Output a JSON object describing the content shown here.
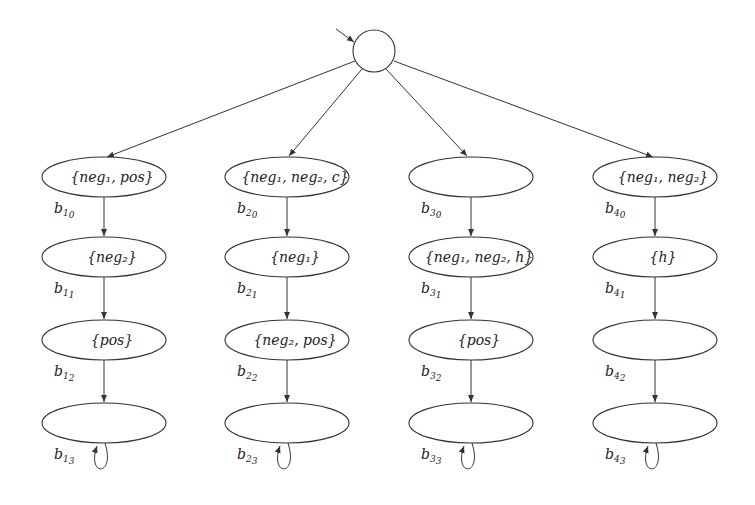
{
  "diagram": {
    "type": "automaton",
    "initial_state": {
      "label": ""
    },
    "branches": [
      {
        "id": "b1",
        "states": [
          {
            "label": "{neg₁, pos}",
            "name": "b",
            "sub1": "1",
            "sub2": "0"
          },
          {
            "label": "{neg₂}",
            "name": "b",
            "sub1": "1",
            "sub2": "1"
          },
          {
            "label": "{pos}",
            "name": "b",
            "sub1": "1",
            "sub2": "2"
          },
          {
            "label": "",
            "name": "b",
            "sub1": "1",
            "sub2": "3"
          }
        ]
      },
      {
        "id": "b2",
        "states": [
          {
            "label": "{neg₁, neg₂, c}",
            "name": "b",
            "sub1": "2",
            "sub2": "0"
          },
          {
            "label": "{neg₁}",
            "name": "b",
            "sub1": "2",
            "sub2": "1"
          },
          {
            "label": "{neg₂, pos}",
            "name": "b",
            "sub1": "2",
            "sub2": "2"
          },
          {
            "label": "",
            "name": "b",
            "sub1": "2",
            "sub2": "3"
          }
        ]
      },
      {
        "id": "b3",
        "states": [
          {
            "label": "",
            "name": "b",
            "sub1": "3",
            "sub2": "0"
          },
          {
            "label": "{neg₁, neg₂, h}",
            "name": "b",
            "sub1": "3",
            "sub2": "1"
          },
          {
            "label": "{pos}",
            "name": "b",
            "sub1": "3",
            "sub2": "2"
          },
          {
            "label": "",
            "name": "b",
            "sub1": "3",
            "sub2": "3"
          }
        ]
      },
      {
        "id": "b4",
        "states": [
          {
            "label": "{neg₁, neg₂}",
            "name": "b",
            "sub1": "4",
            "sub2": "0"
          },
          {
            "label": "{h}",
            "name": "b",
            "sub1": "4",
            "sub2": "1"
          },
          {
            "label": "",
            "name": "b",
            "sub1": "4",
            "sub2": "2"
          },
          {
            "label": "",
            "name": "b",
            "sub1": "4",
            "sub2": "3"
          }
        ]
      }
    ]
  }
}
